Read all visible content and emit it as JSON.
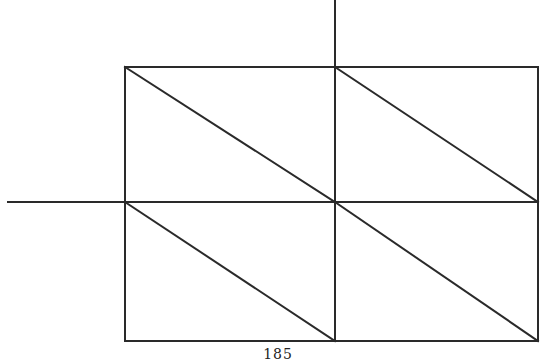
{
  "diagram": {
    "stroke_color": "#2a2a2a",
    "stroke_width": 2,
    "grid": {
      "x": [
        125,
        335,
        538
      ],
      "y": [
        67,
        202,
        341
      ]
    },
    "axis_lines": [
      {
        "name": "vertical-axis-line",
        "x1": 335,
        "y1": 0,
        "x2": 335,
        "y2": 67
      },
      {
        "name": "horizontal-axis-line",
        "x1": 8,
        "y1": 202,
        "x2": 125,
        "y2": 202
      }
    ],
    "cells": [
      {
        "name": "cell-top-left",
        "row": 0,
        "col": 0,
        "diagonal": "top-left-to-bottom-right"
      },
      {
        "name": "cell-top-right",
        "row": 0,
        "col": 1,
        "diagonal": "top-left-to-bottom-right"
      },
      {
        "name": "cell-bottom-left",
        "row": 1,
        "col": 0,
        "diagonal": "top-left-to-bottom-right"
      },
      {
        "name": "cell-bottom-right",
        "row": 1,
        "col": 1,
        "diagonal": "top-left-to-bottom-right"
      }
    ]
  },
  "footer": {
    "page_number": "185"
  }
}
